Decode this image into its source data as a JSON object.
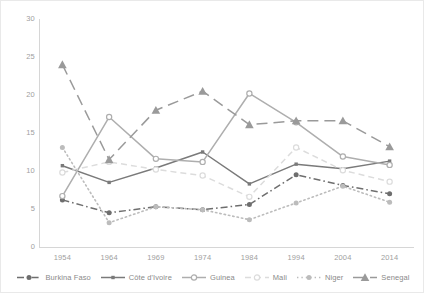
{
  "chart_data": {
    "type": "line",
    "title": "",
    "xlabel": "",
    "ylabel": "",
    "categories": [
      "1954",
      "1964",
      "1969",
      "1974",
      "1984",
      "1994",
      "2004",
      "2014"
    ],
    "ylim": [
      0,
      30
    ],
    "yticks": [
      0,
      5,
      10,
      15,
      20,
      25,
      30
    ],
    "grid": false,
    "legend_position": "bottom",
    "series": [
      {
        "name": "Burkina Faso",
        "marker": "circle-filled",
        "line_style": "dash-dot",
        "color": "#6e6e6e",
        "values": [
          6.2,
          4.5,
          5.3,
          4.9,
          5.6,
          9.5,
          8.1,
          7.0
        ]
      },
      {
        "name": "Côte d'Ivoire",
        "marker": "square-filled",
        "line_style": "solid",
        "color": "#7a7a7a",
        "values": [
          10.7,
          8.5,
          10.4,
          12.5,
          8.3,
          10.9,
          10.3,
          11.3
        ]
      },
      {
        "name": "Guinea",
        "marker": "circle-open",
        "line_style": "solid",
        "color": "#aeaeae",
        "values": [
          6.7,
          17.1,
          11.6,
          11.2,
          20.2,
          16.4,
          11.9,
          10.8
        ]
      },
      {
        "name": "Mali",
        "marker": "circle-open-light",
        "line_style": "dashed",
        "color": "#dcdcdc",
        "values": [
          9.8,
          11.2,
          10.2,
          9.4,
          6.6,
          13.1,
          10.1,
          8.6
        ]
      },
      {
        "name": "Niger",
        "marker": "circle-filled",
        "line_style": "dotted",
        "color": "#bcbcbc",
        "values": [
          13.1,
          3.2,
          5.3,
          4.9,
          3.6,
          5.8,
          8.0,
          5.9
        ]
      },
      {
        "name": "Senegal",
        "marker": "triangle-filled",
        "line_style": "long-dash",
        "color": "#9a9a9a",
        "values": [
          24.0,
          11.5,
          18.0,
          20.5,
          16.1,
          16.6,
          16.6,
          13.2
        ]
      }
    ]
  }
}
